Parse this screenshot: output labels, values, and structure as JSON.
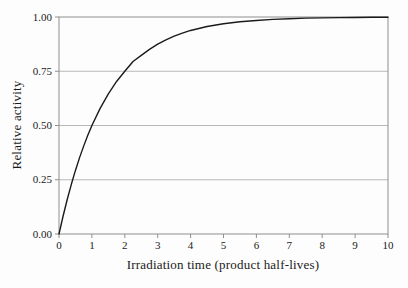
{
  "figure": {
    "background": "#fdfdfd",
    "axis_color": "#8f8f8f",
    "grid_color": "#b8b8b8",
    "curve_color": "#1b1b1b",
    "text_color": "#1a1a1a"
  },
  "chart_data": {
    "type": "line",
    "title": "",
    "xlabel": "Irradiation time (product half-lives)",
    "ylabel": "Relative activity",
    "xlim": [
      0,
      10
    ],
    "ylim": [
      0,
      1.0
    ],
    "xtick_labels": [
      "0",
      "1",
      "2",
      "3",
      "4",
      "5",
      "6",
      "7",
      "8",
      "9",
      "10"
    ],
    "xtick_values": [
      0,
      1,
      2,
      3,
      4,
      5,
      6,
      7,
      8,
      9,
      10
    ],
    "ytick_labels": [
      "0.00",
      "0.25",
      "0.50",
      "0.75",
      "1.00"
    ],
    "ytick_values": [
      0,
      0.25,
      0.5,
      0.75,
      1.0
    ],
    "grid": "horizontal",
    "legend": "none",
    "series": [
      {
        "name": "relative-activity-saturation-curve",
        "x": [
          0,
          0.125,
          0.25,
          0.375,
          0.5,
          0.625,
          0.75,
          0.875,
          1,
          1.25,
          1.5,
          1.75,
          2,
          2.25,
          2.5,
          2.75,
          3,
          3.25,
          3.5,
          3.75,
          4,
          4.5,
          5,
          5.5,
          6,
          6.5,
          7,
          7.5,
          8,
          8.5,
          9,
          9.5,
          10
        ],
        "y": [
          0,
          0.083,
          0.159,
          0.229,
          0.293,
          0.352,
          0.405,
          0.455,
          0.5,
          0.579,
          0.646,
          0.703,
          0.75,
          0.795,
          0.823,
          0.851,
          0.875,
          0.895,
          0.912,
          0.926,
          0.938,
          0.956,
          0.969,
          0.978,
          0.984,
          0.989,
          0.992,
          0.995,
          0.996,
          0.997,
          0.998,
          0.9986,
          0.999
        ]
      }
    ]
  }
}
